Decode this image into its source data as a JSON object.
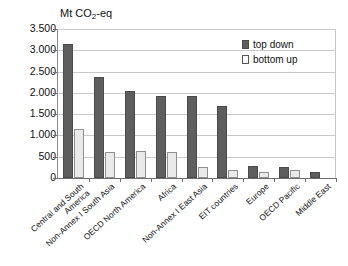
{
  "chart_data": {
    "type": "bar",
    "title": "Mt CO2-eq",
    "title_parts": {
      "prefix": "Mt CO",
      "sub": "2",
      "suffix": "-eq"
    },
    "xlabel": "",
    "ylabel": "Mt CO2-eq",
    "ylim": [
      0,
      3500
    ],
    "ytick_step": 500,
    "ytick_labels": [
      "3.500",
      "3.000",
      "2.500",
      "2.000",
      "1.500",
      "1.000",
      "500",
      "0"
    ],
    "ytick_values": [
      3500,
      3000,
      2500,
      2000,
      1500,
      1000,
      500,
      0
    ],
    "grid": true,
    "legend_position": "top-right",
    "categories": [
      "Central and South America",
      "Non-Annex I South Asia",
      "OECD North America",
      "Africa",
      "Non-Annex I East Asia",
      "EIT countries",
      "Europe",
      "OECD Pacific",
      "Middle East"
    ],
    "category_lines": [
      [
        "Central and South",
        "America"
      ],
      [
        "Non-Annex I South Asia"
      ],
      [
        "OECD North America"
      ],
      [
        "Africa"
      ],
      [
        "Non-Annex I East Asia"
      ],
      [
        "EIT countries"
      ],
      [
        "Europe"
      ],
      [
        "OECD Pacific"
      ],
      [
        "Middle East"
      ]
    ],
    "series": [
      {
        "name": "top down",
        "color": "#5e5e5e",
        "values": [
          3150,
          2380,
          2050,
          1930,
          1930,
          1700,
          280,
          250,
          150
        ]
      },
      {
        "name": "bottom up",
        "color": "#eaeaea",
        "values": [
          1150,
          600,
          630,
          600,
          250,
          200,
          150,
          180,
          0
        ]
      }
    ]
  },
  "legend": {
    "items": [
      {
        "label": "top down",
        "key": "top-down"
      },
      {
        "label": "bottom up",
        "key": "bottom-up"
      }
    ]
  },
  "colors": {
    "top_down": "#5e5e5e",
    "bottom_up": "#eaeaea",
    "grid": "#c9c9c9",
    "axis": "#6d6d6d",
    "text": "#111111",
    "background": "#ffffff"
  }
}
